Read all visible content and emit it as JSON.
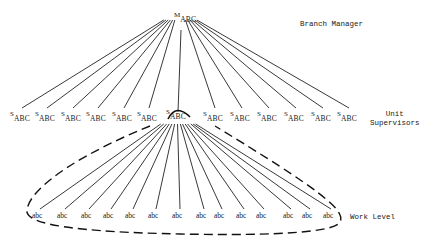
{
  "manager": {
    "main": "M",
    "sub": "ABC",
    "x": 174,
    "y": 18
  },
  "labels": {
    "branch_manager": "Branch Manager",
    "unit_supervisors_1": "Unit",
    "unit_supervisors_2": "Supervisors",
    "work_level": "Work Level"
  },
  "supervisors": [
    {
      "main": "S",
      "sub": "ABC",
      "x": 10
    },
    {
      "main": "S",
      "sub": "ABC",
      "x": 35
    },
    {
      "main": "S",
      "sub": "ABC",
      "x": 61
    },
    {
      "main": "S",
      "sub": "ABC",
      "x": 86
    },
    {
      "main": "S",
      "sub": "ABC",
      "x": 112
    },
    {
      "main": "S",
      "sub": "ABC",
      "x": 137
    },
    {
      "main": "S",
      "sub": "ABC",
      "x": 166
    },
    {
      "main": "S",
      "sub": "ABC",
      "x": 203
    },
    {
      "main": "S",
      "sub": "ABC",
      "x": 230
    },
    {
      "main": "S",
      "sub": "ABC",
      "x": 257
    },
    {
      "main": "S",
      "sub": "ABC",
      "x": 284
    },
    {
      "main": "S",
      "sub": "ABC",
      "x": 311
    },
    {
      "main": "S",
      "sub": "ABC",
      "x": 337
    }
  ],
  "workers": [
    "abc",
    "abc",
    "abc",
    "abc",
    "abc",
    "abc",
    "abc",
    "abc",
    "abc",
    "abc",
    "abc",
    "abc",
    "abc",
    "abc"
  ],
  "worker_x": [
    32,
    57,
    81,
    103,
    125,
    148,
    172,
    196,
    214,
    236,
    256,
    283,
    302,
    323
  ]
}
